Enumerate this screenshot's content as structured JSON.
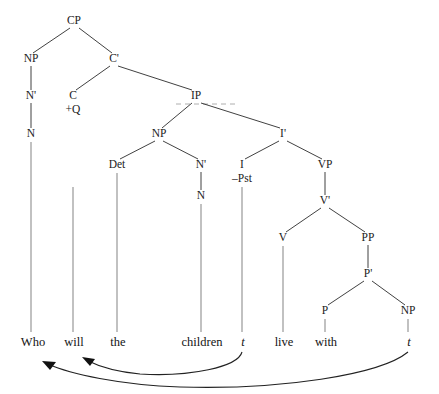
{
  "figure": {
    "kind": "syntax-tree",
    "sentence": "Who will the children live with",
    "width": 439,
    "height": 394,
    "background": "#ffffff",
    "branch_color": "#2b2b2b",
    "stem_color": "#8e8e8e",
    "text_color": "#1b1b1b",
    "arrow_color": "#111111"
  },
  "nodes": [
    {
      "id": "CP",
      "label": "CP",
      "x": 74,
      "y": 24
    },
    {
      "id": "NP1",
      "label": "NP",
      "x": 31,
      "y": 62
    },
    {
      "id": "Cbar",
      "label": "C'",
      "x": 114,
      "y": 62
    },
    {
      "id": "N1bar",
      "label": "N'",
      "x": 31,
      "y": 99
    },
    {
      "id": "C",
      "label": "C",
      "x": 73,
      "y": 99
    },
    {
      "id": "IP",
      "label": "IP",
      "x": 196,
      "y": 99
    },
    {
      "id": "N1",
      "label": "N",
      "x": 31,
      "y": 137
    },
    {
      "id": "NP2",
      "label": "NP",
      "x": 159,
      "y": 137
    },
    {
      "id": "Ibar",
      "label": "I'",
      "x": 283,
      "y": 137
    },
    {
      "id": "Det",
      "label": "Det",
      "x": 117,
      "y": 168
    },
    {
      "id": "N2bar",
      "label": "N'",
      "x": 201,
      "y": 168
    },
    {
      "id": "I",
      "label": "I",
      "x": 242,
      "y": 168
    },
    {
      "id": "VP",
      "label": "VP",
      "x": 325,
      "y": 168
    },
    {
      "id": "N2",
      "label": "N",
      "x": 201,
      "y": 199
    },
    {
      "id": "Vbar",
      "label": "V'",
      "x": 325,
      "y": 204
    },
    {
      "id": "V",
      "label": "V",
      "x": 283,
      "y": 241
    },
    {
      "id": "PP",
      "label": "PP",
      "x": 368,
      "y": 241
    },
    {
      "id": "Pbar",
      "label": "P'",
      "x": 368,
      "y": 277
    },
    {
      "id": "P",
      "label": "P",
      "x": 325,
      "y": 314
    },
    {
      "id": "NP3",
      "label": "NP",
      "x": 408,
      "y": 314
    }
  ],
  "features": [
    {
      "id": "Cfeat",
      "label": "+Q",
      "x": 73,
      "y": 113,
      "parent": "C"
    },
    {
      "id": "Ifeat",
      "label": "–Pst",
      "x": 242,
      "y": 182,
      "parent": "I"
    }
  ],
  "branches": [
    {
      "from": "CP",
      "to": "NP1",
      "x1": 70,
      "y1": 28,
      "x2": 33,
      "y2": 53
    },
    {
      "from": "CP",
      "to": "Cbar",
      "x1": 79,
      "y1": 28,
      "x2": 112,
      "y2": 53
    },
    {
      "from": "NP1",
      "to": "N1bar",
      "x1": 31,
      "y1": 66,
      "x2": 31,
      "y2": 90
    },
    {
      "from": "N1bar",
      "to": "N1",
      "x1": 31,
      "y1": 103,
      "x2": 31,
      "y2": 128
    },
    {
      "from": "Cbar",
      "to": "C",
      "x1": 110,
      "y1": 66,
      "x2": 76,
      "y2": 90
    },
    {
      "from": "Cbar",
      "to": "IP",
      "x1": 118,
      "y1": 66,
      "x2": 192,
      "y2": 90
    },
    {
      "from": "IP",
      "to": "NP2",
      "x1": 192,
      "y1": 103,
      "x2": 162,
      "y2": 128
    },
    {
      "from": "IP",
      "to": "Ibar",
      "x1": 201,
      "y1": 103,
      "x2": 280,
      "y2": 128
    },
    {
      "from": "NP2",
      "to": "Det",
      "x1": 155,
      "y1": 141,
      "x2": 120,
      "y2": 159
    },
    {
      "from": "NP2",
      "to": "N2bar",
      "x1": 163,
      "y1": 141,
      "x2": 198,
      "y2": 159
    },
    {
      "from": "N2bar",
      "to": "N2",
      "x1": 201,
      "y1": 172,
      "x2": 201,
      "y2": 190
    },
    {
      "from": "Ibar",
      "to": "I",
      "x1": 279,
      "y1": 141,
      "x2": 245,
      "y2": 159
    },
    {
      "from": "Ibar",
      "to": "VP",
      "x1": 287,
      "y1": 141,
      "x2": 322,
      "y2": 159
    },
    {
      "from": "VP",
      "to": "Vbar",
      "x1": 325,
      "y1": 172,
      "x2": 325,
      "y2": 195
    },
    {
      "from": "Vbar",
      "to": "V",
      "x1": 321,
      "y1": 208,
      "x2": 286,
      "y2": 232
    },
    {
      "from": "Vbar",
      "to": "PP",
      "x1": 329,
      "y1": 208,
      "x2": 365,
      "y2": 232
    },
    {
      "from": "PP",
      "to": "Pbar",
      "x1": 368,
      "y1": 245,
      "x2": 368,
      "y2": 268
    },
    {
      "from": "Pbar",
      "to": "P",
      "x1": 364,
      "y1": 281,
      "x2": 328,
      "y2": 305
    },
    {
      "from": "Pbar",
      "to": "NP3",
      "x1": 372,
      "y1": 281,
      "x2": 405,
      "y2": 305
    }
  ],
  "stems": [
    {
      "from": "N1",
      "to": "word-who",
      "x": 31,
      "y1": 142,
      "y2": 332
    },
    {
      "from": "I",
      "to": "word-will",
      "x": 73,
      "y1": 187,
      "y2": 332
    },
    {
      "from": "Det",
      "to": "word-the",
      "x": 117,
      "y1": 173,
      "y2": 332
    },
    {
      "from": "N2",
      "to": "word-children",
      "x": 201,
      "y1": 204,
      "y2": 332
    },
    {
      "from": "I",
      "to": "word-trace-1",
      "x": 242,
      "y1": 187,
      "y2": 332
    },
    {
      "from": "V",
      "to": "word-live",
      "x": 283,
      "y1": 246,
      "y2": 332
    },
    {
      "from": "P",
      "to": "word-with",
      "x": 325,
      "y1": 319,
      "y2": 332
    },
    {
      "from": "NP3",
      "to": "word-trace-2",
      "x": 408,
      "y1": 319,
      "y2": 332
    }
  ],
  "terminals": [
    {
      "id": "word-who",
      "text": "Who",
      "x": 33,
      "y": 346,
      "italic": false
    },
    {
      "id": "word-will",
      "text": "will",
      "x": 74,
      "y": 346,
      "italic": false
    },
    {
      "id": "word-the",
      "text": "the",
      "x": 118,
      "y": 346,
      "italic": false
    },
    {
      "id": "word-children",
      "text": "children",
      "x": 202,
      "y": 346,
      "italic": false
    },
    {
      "id": "word-trace-1",
      "text": "t",
      "x": 243,
      "y": 346,
      "italic": true
    },
    {
      "id": "word-live",
      "text": "live",
      "x": 284,
      "y": 346,
      "italic": false
    },
    {
      "id": "word-with",
      "text": "with",
      "x": 326,
      "y": 346,
      "italic": false
    },
    {
      "id": "word-trace-2",
      "text": "t",
      "x": 409,
      "y": 346,
      "italic": true
    }
  ],
  "movements": [
    {
      "id": "move-i-to-c",
      "from": "word-trace-1",
      "to": "word-will",
      "description": "I-to-C head movement: will raises from I to C",
      "path": "M 242 352 C 238 367, 190 377, 140 374 C 118 372, 98 366, 86 360",
      "arrow": "82,357 95,359 90,366"
    },
    {
      "id": "move-wh",
      "from": "word-trace-2",
      "to": "word-who",
      "description": "wh-movement: who raises from object of with to spec-CP",
      "path": "M 408 352 C 380 375, 280 390, 180 387 C 120 385, 70 374, 48 364",
      "arrow": "42,361 56,362 50,370"
    }
  ],
  "artifacts": [
    {
      "id": "scan-line",
      "x1": 176,
      "y1": 104,
      "x2": 236,
      "y2": 104
    }
  ]
}
